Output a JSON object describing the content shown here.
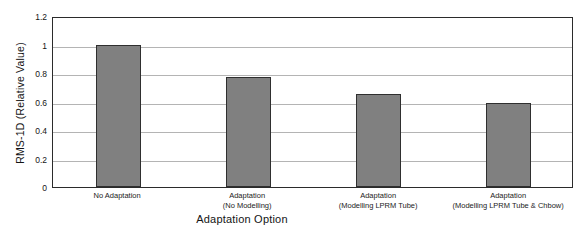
{
  "chart_data": {
    "type": "bar",
    "title": "",
    "subtitle": "",
    "xlabel": "Adaptation Option",
    "ylabel": "RMS-1D (Relative Value)",
    "categories": [
      "No Adaptation",
      "Adaptation\n(No Modelling)",
      "Adaptation\n(Modelling LPRM Tube)",
      "Adaptation\n(Modelling LPRM Tube & Chbow)"
    ],
    "category_lines": [
      {
        "line1": "No Adaptation",
        "line2": ""
      },
      {
        "line1": "Adaptation",
        "line2": "(No Modelling)"
      },
      {
        "line1": "Adaptation",
        "line2": "(Modelling LPRM Tube)"
      },
      {
        "line1": "Adaptation",
        "line2": "(Modelling LPRM Tube & Chbow)"
      }
    ],
    "values": [
      1.0,
      0.775,
      0.655,
      0.59
    ],
    "ylim": [
      0,
      1.2
    ],
    "xlim_note": "categorical",
    "ytick_labels": [
      "0",
      "0.2",
      "0.4",
      "0.6",
      "0.8",
      "1",
      "1.2"
    ],
    "ytick_values": [
      0,
      0.2,
      0.4,
      0.6,
      0.8,
      1,
      1.2
    ],
    "grid": "horizontal",
    "legend": "none",
    "bar_fill_color": "#808080",
    "bar_border_color": "#2f2f2f",
    "gridline_color": "#b4b4b4",
    "axis_color": "#2b2b2b",
    "plot_background": "#ffffff"
  }
}
